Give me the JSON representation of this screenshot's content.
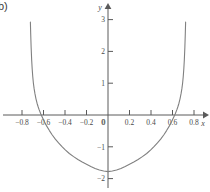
{
  "figure": {
    "panel_label": "b)",
    "background_color": "#ffffff",
    "curve_color": "#808080",
    "axis_color": "#5a5a5a",
    "text_color": "#4a4a4a",
    "width_px": 210,
    "height_px": 192
  },
  "chart_data": {
    "type": "line",
    "title": "",
    "subtitle": "",
    "xlabel": "x",
    "ylabel": "y",
    "xlim": [
      -0.93,
      0.9
    ],
    "ylim": [
      -2.25,
      3.35
    ],
    "grid": false,
    "legend": null,
    "annotations": [],
    "x_ticks": [
      -0.8,
      -0.6,
      -0.4,
      -0.2,
      0,
      0.2,
      0.4,
      0.6,
      0.8
    ],
    "x_tick_labels": [
      "−0.8",
      "−0.6",
      "−0.4",
      "−0.2",
      "0",
      "0.2",
      "0.4",
      "0.6",
      "0.8"
    ],
    "y_ticks": [
      3,
      2,
      1,
      0,
      -1,
      -2
    ],
    "y_tick_labels": [
      "3",
      "2",
      "1",
      "0",
      "−1",
      "−2"
    ],
    "series": [
      {
        "name": "curve",
        "color": "#808080",
        "vertex": [
          0,
          -1.78
        ],
        "x_intercepts": [
          -0.59,
          0.59
        ],
        "y_intercept": -1.78,
        "vertical_asymptotes": [
          -0.73,
          0.73
        ],
        "x": [
          -0.722,
          -0.719,
          -0.715,
          -0.71,
          -0.705,
          -0.7,
          -0.694,
          -0.687,
          -0.68,
          -0.67,
          -0.66,
          -0.65,
          -0.64,
          -0.625,
          -0.61,
          -0.59,
          -0.57,
          -0.545,
          -0.52,
          -0.49,
          -0.46,
          -0.43,
          -0.4,
          -0.36,
          -0.32,
          -0.28,
          -0.24,
          -0.2,
          -0.16,
          -0.12,
          -0.08,
          -0.04,
          0.0,
          0.04,
          0.08,
          0.12,
          0.16,
          0.2,
          0.24,
          0.28,
          0.32,
          0.36,
          0.4,
          0.43,
          0.46,
          0.49,
          0.52,
          0.545,
          0.57,
          0.59,
          0.61,
          0.625,
          0.64,
          0.65,
          0.66,
          0.67,
          0.68,
          0.687,
          0.694,
          0.7,
          0.705,
          0.71,
          0.715,
          0.719,
          0.722
        ],
        "y": [
          2.92,
          2.55,
          2.12,
          1.73,
          1.44,
          1.21,
          1.0,
          0.82,
          0.68,
          0.51,
          0.37,
          0.26,
          0.16,
          0.03,
          -0.08,
          -0.22,
          -0.35,
          -0.49,
          -0.62,
          -0.76,
          -0.88,
          -0.99,
          -1.09,
          -1.21,
          -1.31,
          -1.4,
          -1.48,
          -1.55,
          -1.62,
          -1.68,
          -1.73,
          -1.76,
          -1.78,
          -1.76,
          -1.73,
          -1.68,
          -1.62,
          -1.55,
          -1.48,
          -1.4,
          -1.31,
          -1.21,
          -1.09,
          -0.99,
          -0.88,
          -0.76,
          -0.62,
          -0.49,
          -0.35,
          -0.22,
          -0.08,
          0.03,
          0.16,
          0.26,
          0.37,
          0.51,
          0.68,
          0.82,
          1.0,
          1.21,
          1.44,
          1.73,
          2.12,
          2.55,
          2.92
        ]
      }
    ]
  }
}
